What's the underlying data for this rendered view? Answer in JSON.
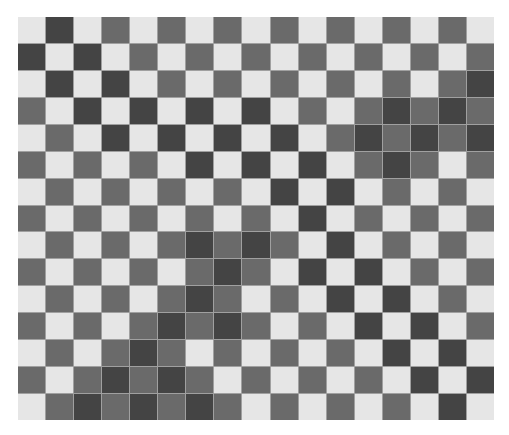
{
  "board": {
    "columns": 17,
    "rows": 15,
    "colors": {
      "L": "#e6e6e6",
      "M": "#6a6a6a",
      "D": "#444444",
      "grid_line": "#a0a0a0"
    },
    "cells": [
      "LDLMLMLMLMLMLMLML",
      "DLDLMLMLMLMLMLMLM",
      "LDLDLMLMLMLMLMLMD",
      "MLDLDLDLDLMLMDMDM",
      "LMLDLDLDLDLMDMDMD",
      "MLMLMLDLDLDLMDMLM",
      "LMLMLMLMLDLDLMLML",
      "MLMLMLMLMLDLMLMLM",
      "LMLMLMDMDMLDLMLML",
      "MLMLMLMDMLDLDLMLM",
      "LMLMLMDMLMLDLDLML",
      "MLMLMDMDMLMLDLDLM",
      "LMLMDMLMLMLMLDLDL",
      "MLMDMDMLMLMLMLDLD",
      "LMDMDMDMLMLMLMLDL"
    ]
  }
}
